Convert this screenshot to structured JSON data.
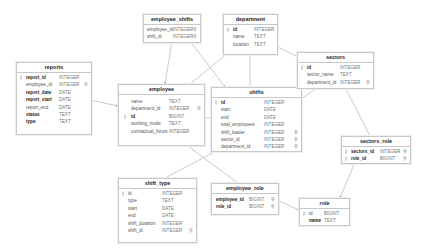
{
  "diagram": {
    "type": "entity-relationship",
    "tables": {
      "employee_shifts": {
        "title": "employee_shifts",
        "columns": [
          {
            "name": "employee_id",
            "type": "INTEGER",
            "pk": false,
            "fk": true,
            "bold": false
          },
          {
            "name": "shift_id",
            "type": "INTEGER",
            "pk": false,
            "fk": true,
            "bold": false
          }
        ]
      },
      "department": {
        "title": "department",
        "columns": [
          {
            "name": "id",
            "type": "INTEGER",
            "pk": true,
            "fk": false,
            "bold": true
          },
          {
            "name": "name",
            "type": "TEXT",
            "pk": false,
            "fk": false,
            "bold": false
          },
          {
            "name": "location",
            "type": "TEXT",
            "pk": false,
            "fk": false,
            "bold": false
          }
        ]
      },
      "reports": {
        "title": "reports",
        "columns": [
          {
            "name": "report_id",
            "type": "INTEGER",
            "pk": true,
            "fk": false,
            "bold": true
          },
          {
            "name": "employee_id",
            "type": "INTEGER",
            "pk": false,
            "fk": true,
            "bold": false
          },
          {
            "name": "report_date",
            "type": "DATE",
            "pk": false,
            "fk": false,
            "bold": true
          },
          {
            "name": "report_start",
            "type": "DATE",
            "pk": false,
            "fk": false,
            "bold": true
          },
          {
            "name": "report_end",
            "type": "DATE",
            "pk": false,
            "fk": false,
            "bold": false
          },
          {
            "name": "status",
            "type": "TEXT",
            "pk": false,
            "fk": false,
            "bold": true
          },
          {
            "name": "type",
            "type": "TEXT",
            "pk": false,
            "fk": false,
            "bold": true
          }
        ]
      },
      "employee": {
        "title": "employee",
        "columns": [
          {
            "name": "name",
            "type": "TEXT",
            "pk": false,
            "fk": false,
            "bold": false
          },
          {
            "name": "department_id",
            "type": "INTEGER",
            "pk": false,
            "fk": true,
            "bold": false
          },
          {
            "name": "id",
            "type": "BIGINT",
            "pk": true,
            "fk": false,
            "bold": true
          },
          {
            "name": "working_mode",
            "type": "TEXT",
            "pk": false,
            "fk": false,
            "bold": false
          },
          {
            "name": "contractual_hours",
            "type": "INTEGER",
            "pk": false,
            "fk": false,
            "bold": false
          }
        ]
      },
      "shifts": {
        "title": "shifts",
        "columns": [
          {
            "name": "id",
            "type": "INTEGER",
            "pk": true,
            "fk": false,
            "bold": true
          },
          {
            "name": "start",
            "type": "DATE",
            "pk": false,
            "fk": false,
            "bold": false
          },
          {
            "name": "end",
            "type": "DATE",
            "pk": false,
            "fk": false,
            "bold": false
          },
          {
            "name": "total_employees",
            "type": "INTEGER",
            "pk": false,
            "fk": false,
            "bold": false
          },
          {
            "name": "shift_leader",
            "type": "INTEGER",
            "pk": false,
            "fk": true,
            "bold": false
          },
          {
            "name": "sector_id",
            "type": "INTEGER",
            "pk": false,
            "fk": true,
            "bold": false
          },
          {
            "name": "department_id",
            "type": "INTEGER",
            "pk": false,
            "fk": true,
            "bold": false
          }
        ]
      },
      "sectors": {
        "title": "sectors",
        "columns": [
          {
            "name": "id",
            "type": "INTEGER",
            "pk": true,
            "fk": false,
            "bold": true
          },
          {
            "name": "sector_name",
            "type": "TEXT",
            "pk": false,
            "fk": false,
            "bold": false
          },
          {
            "name": "department_id",
            "type": "INTEGER",
            "pk": false,
            "fk": true,
            "bold": false
          }
        ]
      },
      "sectors_role": {
        "title": "sectors_role",
        "columns": [
          {
            "name": "sectors_id",
            "type": "INTEGER",
            "pk": true,
            "fk": true,
            "bold": true
          },
          {
            "name": "role_id",
            "type": "BIGINT",
            "pk": true,
            "fk": true,
            "bold": true
          }
        ]
      },
      "shift_type": {
        "title": "shift_type",
        "columns": [
          {
            "name": "id",
            "type": "INTEGER",
            "pk": true,
            "fk": false,
            "bold": false
          },
          {
            "name": "type",
            "type": "TEXT",
            "pk": false,
            "fk": false,
            "bold": false
          },
          {
            "name": "start",
            "type": "DATE",
            "pk": false,
            "fk": false,
            "bold": false
          },
          {
            "name": "end",
            "type": "DATE",
            "pk": false,
            "fk": false,
            "bold": false
          },
          {
            "name": "shift_duration",
            "type": "INTEGER",
            "pk": false,
            "fk": false,
            "bold": false
          },
          {
            "name": "shift_id",
            "type": "INTEGER",
            "pk": false,
            "fk": true,
            "bold": false
          }
        ]
      },
      "employee_role": {
        "title": "employee_role",
        "columns": [
          {
            "name": "employee_id",
            "type": "BIGINT",
            "pk": false,
            "fk": true,
            "bold": true
          },
          {
            "name": "role_id",
            "type": "BIGINT",
            "pk": false,
            "fk": true,
            "bold": true
          }
        ]
      },
      "role": {
        "title": "role",
        "columns": [
          {
            "name": "id",
            "type": "BIGINT",
            "pk": true,
            "fk": false,
            "bold": false
          },
          {
            "name": "name",
            "type": "TEXT",
            "pk": false,
            "fk": false,
            "bold": true
          }
        ]
      }
    },
    "relationships": [
      {
        "from": "employee_shifts",
        "to": "employee"
      },
      {
        "from": "employee_shifts",
        "to": "shifts"
      },
      {
        "from": "employee",
        "to": "department"
      },
      {
        "from": "shifts",
        "to": "department"
      },
      {
        "from": "sectors",
        "to": "department"
      },
      {
        "from": "reports",
        "to": "employee"
      },
      {
        "from": "shifts",
        "to": "employee"
      },
      {
        "from": "shifts",
        "to": "sectors"
      },
      {
        "from": "sectors_role",
        "to": "sectors"
      },
      {
        "from": "sectors_role",
        "to": "role"
      },
      {
        "from": "shift_type",
        "to": "shifts"
      },
      {
        "from": "employee_role",
        "to": "employee"
      },
      {
        "from": "employee_role",
        "to": "role"
      }
    ],
    "icons": {
      "pk": "key-icon",
      "fk": "link-key-icon"
    },
    "colors": {
      "border": "#c8c8c8",
      "line": "#9a9a9a",
      "background": "#ffffff"
    }
  }
}
